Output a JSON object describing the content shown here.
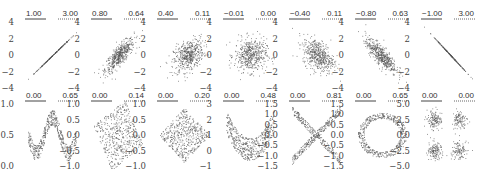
{
  "chart_data": {
    "type": "scatter",
    "title": "",
    "layout": {
      "rows": 2,
      "cols": 7,
      "grid": false,
      "legend": "none"
    },
    "panels": [
      {
        "row": 0,
        "col": 0,
        "shape": "line",
        "corr_label": "1.00",
        "stat_label": "3.00",
        "yticks": [
          "4",
          "2",
          "0",
          "−2",
          "−4"
        ],
        "ylim": [
          -4,
          4
        ],
        "slope": 1
      },
      {
        "row": 0,
        "col": 1,
        "shape": "gaussian",
        "corr_label": "0.80",
        "stat_label": "0.64",
        "yticks": [
          "4",
          "2",
          "0",
          "−2",
          "−4"
        ],
        "ylim": [
          -4,
          4
        ],
        "rho": 0.8
      },
      {
        "row": 0,
        "col": 2,
        "shape": "gaussian",
        "corr_label": "0.40",
        "stat_label": "0.11",
        "yticks": [
          "4",
          "2",
          "0",
          "−2",
          "−4"
        ],
        "ylim": [
          -4,
          4
        ],
        "rho": 0.4
      },
      {
        "row": 0,
        "col": 3,
        "shape": "gaussian",
        "corr_label": "−0.01",
        "stat_label": "0.00",
        "yticks": [
          "4",
          "2",
          "0",
          "−2",
          "−4"
        ],
        "ylim": [
          -4,
          4
        ],
        "rho": 0.0
      },
      {
        "row": 0,
        "col": 4,
        "shape": "gaussian",
        "corr_label": "−0.40",
        "stat_label": "0.11",
        "yticks": [
          "4",
          "2",
          "0",
          "−2",
          "−4"
        ],
        "ylim": [
          -4,
          4
        ],
        "rho": -0.4
      },
      {
        "row": 0,
        "col": 5,
        "shape": "gaussian",
        "corr_label": "−0.80",
        "stat_label": "0.63",
        "yticks": [
          "4",
          "2",
          "0",
          "−2",
          "−4"
        ],
        "ylim": [
          -4,
          4
        ],
        "rho": -0.8
      },
      {
        "row": 0,
        "col": 6,
        "shape": "line",
        "corr_label": "−1.00",
        "stat_label": "3.00",
        "yticks": [
          "4",
          "2",
          "0",
          "−2",
          "−4"
        ],
        "ylim": [
          -4,
          4
        ],
        "slope": -1
      },
      {
        "row": 1,
        "col": 0,
        "shape": "wave",
        "corr_label": "0.00",
        "stat_label": "0.65",
        "yticks": [
          "1.0",
          "0.5",
          "0.0"
        ],
        "ylim": [
          -0.2,
          1.2
        ]
      },
      {
        "row": 1,
        "col": 1,
        "shape": "rotated_square",
        "corr_label": "0.00",
        "stat_label": "0.14",
        "yticks": [
          "1.0",
          "0.5",
          "0.0",
          "−0.5",
          "−1.0"
        ],
        "ylim": [
          -1.2,
          1.2
        ]
      },
      {
        "row": 1,
        "col": 2,
        "shape": "diamond",
        "corr_label": "0.00",
        "stat_label": "0.20",
        "yticks": [
          "1.0",
          "0.5",
          "0.0",
          "−0.5",
          "−1.0"
        ],
        "ylim": [
          -1.2,
          1.2
        ]
      },
      {
        "row": 1,
        "col": 3,
        "shape": "parabola",
        "corr_label": "0.00",
        "stat_label": "0.48",
        "yticks": [
          "3",
          "2",
          "1",
          "0",
          "−1"
        ],
        "ylim": [
          -1.2,
          3.2
        ]
      },
      {
        "row": 1,
        "col": 4,
        "shape": "x_cross",
        "corr_label": "0.00",
        "stat_label": "0.81",
        "yticks": [
          "1.5",
          "1.0",
          "0.5",
          "0.0",
          "−0.5",
          "−1.0",
          "−1.5"
        ],
        "ylim": [
          -1.6,
          1.6
        ]
      },
      {
        "row": 1,
        "col": 5,
        "shape": "ring",
        "corr_label": "0.00",
        "stat_label": "0.65",
        "yticks": [
          "1.5",
          "1.0",
          "0.5",
          "0.0",
          "−0.5",
          "−1.0",
          "−1.5"
        ],
        "ylim": [
          -1.6,
          1.6
        ]
      },
      {
        "row": 1,
        "col": 6,
        "shape": "four_clusters",
        "corr_label": "0.00",
        "stat_label": "0.00",
        "yticks": [
          "5.0",
          "2.5",
          "0.0",
          "−2.5",
          "−5.0"
        ],
        "ylim": [
          -6,
          6
        ]
      }
    ],
    "colors": {
      "points": "#555555",
      "text": "#333333",
      "underline_solid": "#444444",
      "underline_dotted": "#666666"
    }
  }
}
